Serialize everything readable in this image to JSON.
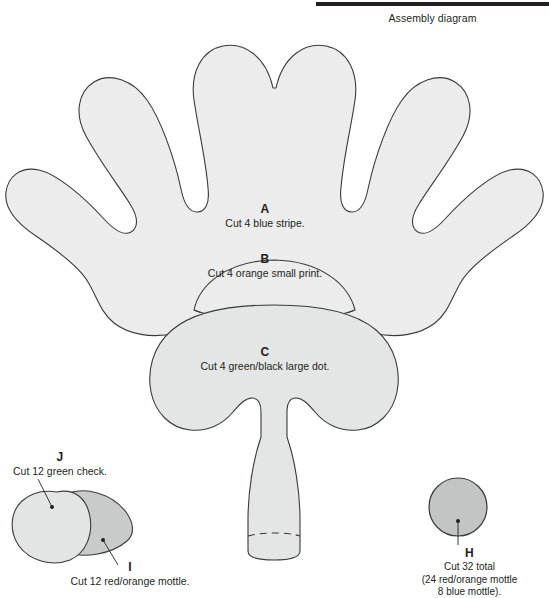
{
  "header": {
    "title": "Assembly diagram",
    "rule_color": "#231f20"
  },
  "palette": {
    "outline": "#3a3a3c",
    "fill_light": "#ececed",
    "fill_mid_light": "#e3e4e4",
    "fill_mid": "#c9caca",
    "fill_dark": "#bcbdbd",
    "text": "#231f20",
    "background": "#ffffff"
  },
  "pieces": [
    {
      "id": "a",
      "key": "A",
      "description": "Cut 4 blue stripe.",
      "shape": "petal-fan",
      "fill": "#ececed"
    },
    {
      "id": "b",
      "key": "B",
      "description": "Cut 4 orange small print.",
      "shape": "dome",
      "fill": "#ececed"
    },
    {
      "id": "c",
      "key": "C",
      "description": "Cut 4 green/black large dot.",
      "shape": "lobed-body-with-stem",
      "fill": "#e4e5e5"
    },
    {
      "id": "j",
      "key": "J",
      "description": "Cut 12 green check.",
      "shape": "leaf-round",
      "fill": "#e3e4e4"
    },
    {
      "id": "i",
      "key": "I",
      "description": "Cut 12 red/orange mottle.",
      "shape": "leaf-pointed",
      "fill": "#c9caca"
    },
    {
      "id": "h",
      "key": "H",
      "description_lines": [
        "Cut 32 total",
        "(24 red/orange mottle",
        "8 blue mottle)."
      ],
      "shape": "circle",
      "fill": "#c3c4c4"
    }
  ]
}
